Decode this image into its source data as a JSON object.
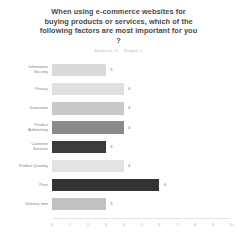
{
  "chart_data": {
    "type": "bar",
    "orientation": "horizontal",
    "title": "When using e-commerce websites for\nbuying products or services, which of the\nfollowing factors are most important for you\n?",
    "subtitle": "Answered: 21    Skipped: 0",
    "categories": [
      "Information\nSecurity",
      "Privacy",
      "Guarantee",
      "Product\nAuthenticity",
      "Customer\nServices",
      "Product Quantity",
      "Price",
      "Delivery time"
    ],
    "values": [
      3,
      4,
      4,
      4,
      3,
      4,
      6,
      3
    ],
    "bar_colors": [
      "#d9d9d9",
      "#e0e0e0",
      "#c8c8c8",
      "#8a8a8a",
      "#3b3b3b",
      "#e3e3e3",
      "#333333",
      "#c2c2c2"
    ],
    "xlabel": "",
    "ylabel": "",
    "xlim": [
      0,
      10
    ],
    "xticks": [
      "0",
      "1",
      "2",
      "3",
      "4",
      "5",
      "6",
      "7",
      "8",
      "9",
      "10"
    ],
    "grid": false,
    "legend": false
  }
}
